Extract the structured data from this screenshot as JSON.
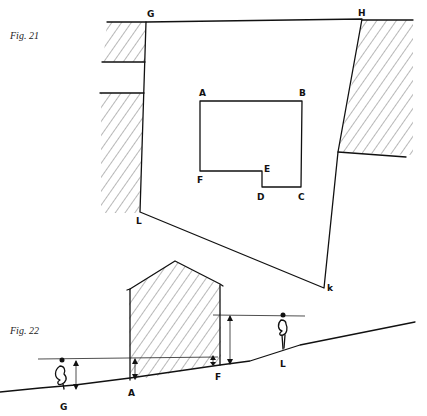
{
  "figures": [
    {
      "label": "Fig. 21",
      "description": "Plan view of a square bounded by buildings",
      "points": {
        "G": "G",
        "H": "H",
        "A": "A",
        "B": "B",
        "C": "C",
        "D": "D",
        "E": "E",
        "F": "F",
        "K": "k",
        "L": "L"
      }
    },
    {
      "label": "Fig. 22",
      "description": "Section showing sloping ground, building and viewer eye levels",
      "points": {
        "G": "G",
        "A": "A",
        "F": "F",
        "L": "L"
      }
    }
  ],
  "colors": {
    "ink": "#111111",
    "background": "#ffffff"
  }
}
